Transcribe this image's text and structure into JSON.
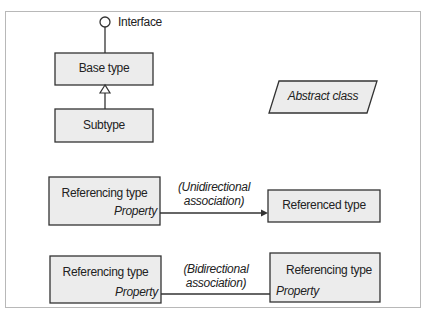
{
  "diagram": {
    "interface": {
      "label": "Interface"
    },
    "base_type": {
      "label": "Base type"
    },
    "subtype": {
      "label": "Subtype"
    },
    "abstract_class": {
      "label": "Abstract class"
    },
    "unidirectional": {
      "source": {
        "label": "Referencing type",
        "property": "Property"
      },
      "association_label_line1": "(Unidirectional",
      "association_label_line2": "association)",
      "target": {
        "label": "Referenced type"
      }
    },
    "bidirectional": {
      "source": {
        "label": "Referencing type",
        "property": "Property"
      },
      "association_label_line1": "(Bidirectional",
      "association_label_line2": "association)",
      "target": {
        "label": "Referencing type",
        "property": "Property"
      }
    }
  },
  "colors": {
    "box_fill": "#ececec",
    "stroke": "#333333",
    "frame": "#b8b8b8"
  }
}
